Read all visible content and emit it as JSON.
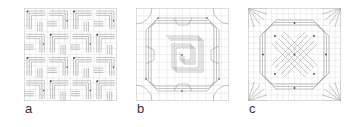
{
  "figure": {
    "panels": [
      {
        "id": "a",
        "label": "a",
        "x": 24,
        "pattern": "tessellation-a"
      },
      {
        "id": "b",
        "label": "b",
        "x": 136,
        "pattern": "tessellation-b"
      },
      {
        "id": "c",
        "label": "c",
        "x": 248,
        "pattern": "tessellation-c"
      }
    ]
  },
  "colors": {
    "grid": "#d9d9d9",
    "crease": "#8c8c8c",
    "border": "#bdbdbd",
    "node": "#444444",
    "label": "#333333"
  }
}
